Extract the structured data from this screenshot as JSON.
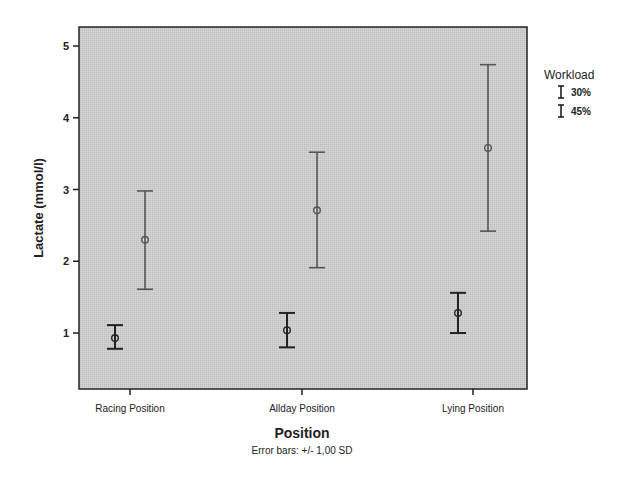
{
  "chart_data": {
    "type": "errorbar",
    "title": "",
    "xlabel": "Position",
    "ylabel": "Lactate (mmol/l)",
    "note": "Error bars: +/- 1,00 SD",
    "categories": [
      "Racing Position",
      "Allday Position",
      "Lying Position"
    ],
    "yticks": [
      1,
      2,
      3,
      4,
      5
    ],
    "ylim": [
      0.22,
      5.27
    ],
    "grid": false,
    "legend": {
      "title": "Workload",
      "position": "right"
    },
    "series": [
      {
        "name": "30%",
        "color": "#222222",
        "mean": [
          0.93,
          1.04,
          1.28
        ],
        "lower": [
          0.78,
          0.8,
          1.0
        ],
        "upper": [
          1.11,
          1.28,
          1.56
        ]
      },
      {
        "name": "45%",
        "color": "#555555",
        "mean": [
          2.3,
          2.71,
          3.58
        ],
        "lower": [
          1.61,
          1.91,
          2.42
        ],
        "upper": [
          2.98,
          3.52,
          4.74
        ]
      }
    ]
  },
  "colors": {
    "plot_bg": "#c9c9c9",
    "frame": "#222222"
  }
}
